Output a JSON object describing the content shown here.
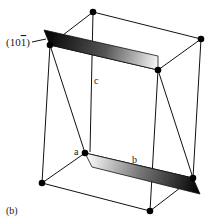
{
  "figure": {
    "panel_label": "(b)",
    "plane_label": "(10",
    "plane_label_bar_digit": "1",
    "plane_label_close": ")",
    "axis_labels": {
      "a": "a",
      "b": "b",
      "c": "c"
    },
    "colors": {
      "line": "#111111",
      "atom": "#000000",
      "plane_dark": "#000000",
      "plane_light": "#f2f2f2"
    }
  }
}
